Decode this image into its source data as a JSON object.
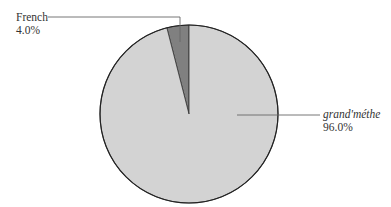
{
  "chart_data": {
    "type": "pie",
    "title": "",
    "slices": [
      {
        "label": "French",
        "value": 4.0,
        "value_label": "4.0%",
        "color": "#808080",
        "italic": false
      },
      {
        "label": "grand'méthe",
        "value": 96.0,
        "value_label": "96.0%",
        "color": "#d3d3d3",
        "italic": true
      }
    ],
    "start_angle": "12 o'clock",
    "direction": "French slice counter-clockwise from top",
    "legend": "none (leader-line labels)"
  },
  "labels": {
    "french": {
      "name": "French",
      "pct": "4.0%"
    },
    "grand": {
      "name": "grand'méthe",
      "pct": "96.0%"
    }
  },
  "colors": {
    "outline": "#222222",
    "leader": "#666666"
  }
}
